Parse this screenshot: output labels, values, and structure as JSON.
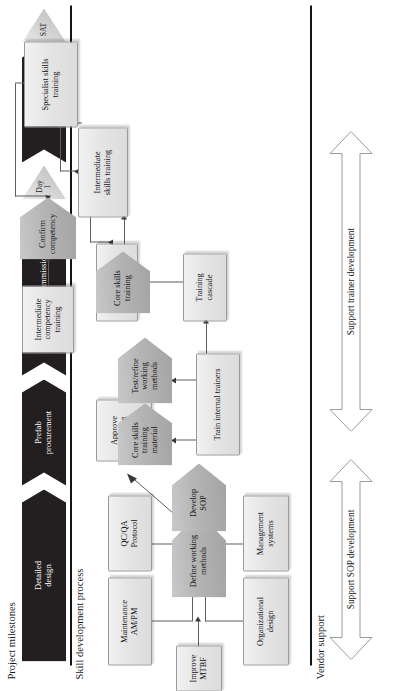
{
  "figure": {
    "sections": {
      "milestones_label": "Project milestones",
      "process_label": "Skill development process",
      "vendor_label": "Vendor support"
    },
    "milestones": {
      "phases": [
        {
          "name": "detailed-design",
          "label": "Detailed\ndesign"
        },
        {
          "name": "prefab-procurement",
          "label": "Prefab\nprocurement"
        },
        {
          "name": "installation-commissioning",
          "label": "Installation /commissioning"
        },
        {
          "name": "stabilize",
          "label": "Stabilize"
        }
      ],
      "markers": [
        {
          "name": "milestone-day-1",
          "label": "Day\n1"
        },
        {
          "name": "milestone-sat",
          "label": "SAT"
        }
      ]
    },
    "nodes": [
      {
        "id": "maintenance",
        "label": "Maintenance\nAM/PM",
        "shape": "box"
      },
      {
        "id": "qcqa",
        "label": "QC/QA\nProtocol",
        "shape": "box"
      },
      {
        "id": "improve-mtbf",
        "label": "Improve\nMTBF",
        "shape": "box"
      },
      {
        "id": "organizational",
        "label": "Organizational\ndesign",
        "shape": "box"
      },
      {
        "id": "management",
        "label": "Management\nsystems",
        "shape": "box"
      },
      {
        "id": "define-working",
        "label": "Define working\nmethods",
        "shape": "pentagon"
      },
      {
        "id": "develop-sop",
        "label": "Develop\nSOP",
        "shape": "pentagon"
      },
      {
        "id": "approve-working",
        "label": "Approve\nworking\nmethods",
        "shape": "box"
      },
      {
        "id": "core-skills-mat",
        "label": "Core skills\ntraining\nmaterial",
        "shape": "pentagon"
      },
      {
        "id": "test-refine",
        "label": "Test/refine\nworking\nmethods",
        "shape": "pentagon"
      },
      {
        "id": "train-internal",
        "label": "Train internal trainers",
        "shape": "box"
      },
      {
        "id": "confirm-comp-1",
        "label": "Confirm\ncompetency",
        "shape": "box"
      },
      {
        "id": "core-skills-train",
        "label": "Core skills\ntraining",
        "shape": "pentagon"
      },
      {
        "id": "training-cascade",
        "label": "Training\ncascade",
        "shape": "box"
      },
      {
        "id": "intermediate-comp",
        "label": "Intermediate\ncompetency\ntraining",
        "shape": "box"
      },
      {
        "id": "confirm-comp-2",
        "label": "Confirm\ncompetency",
        "shape": "pentagon"
      },
      {
        "id": "intermediate-skills",
        "label": "Intermediate\nskills training",
        "shape": "box"
      },
      {
        "id": "specialist-skills",
        "label": "Specialist skills\ntraining",
        "shape": "box"
      }
    ],
    "vendor_arrows": [
      {
        "name": "support-sop-development",
        "label": "Support SOP development"
      },
      {
        "name": "support-trainer-development",
        "label": "Support trainer development"
      }
    ],
    "colors": {
      "phase_fill": "#231f20",
      "marker_fill": "#cfcfcf",
      "box_fill": "#e6e6e6",
      "pentagon_fill": "#b4b4b4",
      "line": "#5e5e5e",
      "rule": "#141414"
    }
  }
}
